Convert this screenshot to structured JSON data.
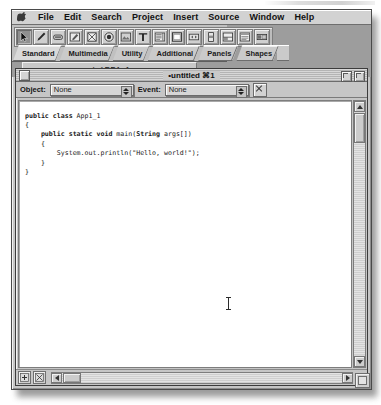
{
  "window": {
    "title": "Java IDE"
  },
  "menubar": {
    "apple_icon": "apple-icon",
    "items": [
      {
        "label": "File"
      },
      {
        "label": "Edit"
      },
      {
        "label": "Search"
      },
      {
        "label": "Project"
      },
      {
        "label": "Insert"
      },
      {
        "label": "Source"
      },
      {
        "label": "Window"
      },
      {
        "label": "Help"
      }
    ]
  },
  "palette": {
    "tools": [
      {
        "name": "arrow-pointer-icon",
        "selected": true
      },
      {
        "name": "hand-grabber-icon",
        "selected": false
      },
      {
        "name": "button-widget-icon",
        "selected": false
      },
      {
        "name": "edit-field-icon",
        "selected": false
      },
      {
        "name": "checkbox-widget-icon",
        "selected": false
      },
      {
        "name": "radio-button-icon",
        "selected": false
      },
      {
        "name": "image-widget-icon",
        "selected": false
      },
      {
        "name": "text-label-icon",
        "selected": false
      },
      {
        "name": "list-box-icon",
        "selected": false
      },
      {
        "name": "panel-widget-icon",
        "selected": false
      },
      {
        "name": "scroller-widget-icon",
        "selected": false
      },
      {
        "name": "slider-widget-icon",
        "selected": false
      },
      {
        "name": "split-pane-icon",
        "selected": false
      },
      {
        "name": "menu-bar-icon",
        "selected": false
      },
      {
        "name": "progress-bar-icon",
        "selected": false
      }
    ],
    "tabs": [
      {
        "label": "Standard",
        "active": true
      },
      {
        "label": "Multimedia",
        "active": false
      },
      {
        "label": "Utility",
        "active": false
      },
      {
        "label": "Additional",
        "active": false
      },
      {
        "label": "Panels",
        "active": false
      },
      {
        "label": "Shapes",
        "active": false
      }
    ]
  },
  "project_tab": {
    "check_glyph": "✓",
    "label": "APP1_1"
  },
  "document": {
    "title_bullet": "•",
    "title": "untitled",
    "title_cmd": "⌘1",
    "title_full": "•untitled ⌘1",
    "close_box": "close-box",
    "zoom_box": "zoom-box",
    "collapse_box": "collapse-box"
  },
  "inspector": {
    "object_label": "Object:",
    "object_value": "None",
    "event_label": "Event:",
    "event_value": "None",
    "delete_button": "×"
  },
  "editor": {
    "language": "Java",
    "lines": [
      {
        "indent": 0,
        "segments": [
          {
            "t": "public class ",
            "b": true
          },
          {
            "t": "App1_1",
            "b": false
          }
        ]
      },
      {
        "indent": 0,
        "segments": [
          {
            "t": "{",
            "b": false
          }
        ]
      },
      {
        "indent": 1,
        "segments": [
          {
            "t": "public static void ",
            "b": true
          },
          {
            "t": "main(",
            "b": false
          },
          {
            "t": "String",
            "b": true
          },
          {
            "t": " args[])",
            "b": false
          }
        ]
      },
      {
        "indent": 1,
        "segments": [
          {
            "t": "{",
            "b": false
          }
        ]
      },
      {
        "indent": 2,
        "segments": [
          {
            "t": "System.out.println(\"Hello, world!\");",
            "b": false
          }
        ]
      },
      {
        "indent": 1,
        "segments": [
          {
            "t": "}",
            "b": false
          }
        ]
      },
      {
        "indent": 0,
        "segments": [
          {
            "t": "}",
            "b": false
          }
        ]
      }
    ],
    "plain_text": "public class App1_1\n{\n    public static void main(String args[])\n    {\n        System.out.println(\"Hello, world!\");\n    }\n}",
    "cursor": "i-beam-pointer"
  },
  "scrollbars": {
    "vertical": {
      "up": "▲",
      "down": "▼"
    },
    "horizontal": {
      "left": "◀",
      "right": "▶"
    }
  },
  "status_buttons": [
    {
      "name": "breakpoint-toggle-button"
    },
    {
      "name": "function-popup-button"
    }
  ]
}
